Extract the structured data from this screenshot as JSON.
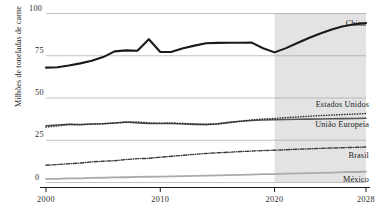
{
  "chart_data": {
    "type": "line",
    "title": "",
    "xlabel": "",
    "ylabel": "Milhões de toneladas de carne",
    "xlim": [
      2000,
      2028
    ],
    "ylim": [
      0,
      100
    ],
    "grid": true,
    "legend_position": "inline-right",
    "yticks": [
      "0",
      "25",
      "50",
      "75",
      "100"
    ],
    "ytick_values": [
      0,
      25,
      50,
      75,
      100
    ],
    "xticks": [
      "2000",
      "2010",
      "2020",
      "2028"
    ],
    "xtick_values": [
      2000,
      2010,
      2020,
      2028
    ],
    "forecast_shading": {
      "from": 2020,
      "to": 2028,
      "color": "#e3e3e3"
    },
    "x": [
      2000,
      2001,
      2002,
      2003,
      2004,
      2005,
      2006,
      2007,
      2008,
      2009,
      2010,
      2011,
      2012,
      2013,
      2014,
      2015,
      2016,
      2017,
      2018,
      2019,
      2020,
      2021,
      2022,
      2023,
      2024,
      2025,
      2026,
      2027,
      2028
    ],
    "series": [
      {
        "name": "China",
        "style": "solid",
        "color": "#1a1a1a",
        "width": 2.1,
        "values": [
          68.0,
          68.2,
          69.2,
          70.5,
          72.0,
          74.2,
          77.6,
          78.2,
          78.0,
          84.8,
          77.2,
          77.3,
          79.4,
          81.0,
          82.4,
          82.6,
          82.7,
          82.7,
          82.8,
          79.4,
          77.0,
          79.5,
          82.5,
          85.5,
          88.2,
          90.6,
          92.4,
          93.6,
          94.3
        ]
      },
      {
        "name": "Estados Unidos",
        "style": "dotted",
        "color": "#2b2b2b",
        "width": 1.5,
        "values": [
          32.8,
          33.5,
          34.3,
          34.1,
          34.5,
          34.8,
          35.2,
          35.6,
          35.9,
          35.2,
          35.1,
          35.2,
          35.0,
          34.6,
          34.2,
          34.5,
          35.4,
          36.2,
          37.0,
          37.6,
          37.9,
          38.4,
          38.8,
          39.2,
          39.6,
          39.9,
          40.2,
          40.5,
          40.8
        ]
      },
      {
        "name": "União Europeia",
        "style": "solid",
        "color": "#555555",
        "width": 1.6,
        "values": [
          33.6,
          34.0,
          34.4,
          34.3,
          34.6,
          34.8,
          35.2,
          35.8,
          35.3,
          35.0,
          34.9,
          34.9,
          34.6,
          34.4,
          34.4,
          34.8,
          35.6,
          36.2,
          36.7,
          37.0,
          37.1,
          37.3,
          37.4,
          37.5,
          37.6,
          37.7,
          37.8,
          37.9,
          38.0
        ]
      },
      {
        "name": "Brasil",
        "style": "dashdot",
        "color": "#3a3a3a",
        "width": 1.4,
        "values": [
          10.2,
          10.6,
          11.1,
          11.5,
          12.2,
          12.6,
          12.9,
          13.6,
          14.1,
          14.3,
          15.0,
          15.5,
          16.1,
          16.7,
          17.2,
          17.6,
          17.9,
          18.3,
          18.6,
          18.9,
          19.1,
          19.4,
          19.7,
          19.9,
          20.2,
          20.4,
          20.6,
          20.8,
          21.0
        ]
      },
      {
        "name": "México",
        "style": "solid",
        "color": "#aaaaaa",
        "width": 1.8,
        "values": [
          2.1,
          2.2,
          2.4,
          2.5,
          2.7,
          2.8,
          3.0,
          3.1,
          3.3,
          3.4,
          3.5,
          3.6,
          3.8,
          3.9,
          4.1,
          4.2,
          4.4,
          4.5,
          4.7,
          4.9,
          5.0,
          5.2,
          5.4,
          5.5,
          5.7,
          5.9,
          6.1,
          6.2,
          6.4
        ]
      }
    ]
  }
}
